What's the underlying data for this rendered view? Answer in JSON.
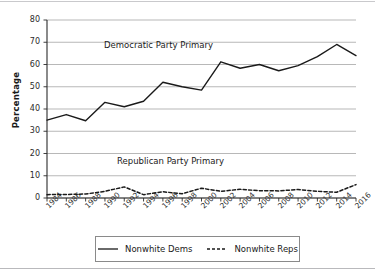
{
  "chart_data": {
    "type": "line",
    "title": "",
    "xlabel": "",
    "ylabel": "Percentage",
    "xlim": [
      1984,
      2016
    ],
    "ylim": [
      0,
      80
    ],
    "ytick_step": 10,
    "grid": true,
    "grid_axis": "y",
    "legend_position": "below-center",
    "x": [
      1984,
      1986,
      1988,
      1990,
      1992,
      1994,
      1996,
      1998,
      2000,
      2002,
      2004,
      2006,
      2008,
      2010,
      2012,
      2014,
      2016
    ],
    "xtick_labels": [
      "1984",
      "1986",
      "1988",
      "1990",
      "1992",
      "1994",
      "1996",
      "1998",
      "2000",
      "2002",
      "2004",
      "2006",
      "2008",
      "2010",
      "2012",
      "2014",
      "2016"
    ],
    "ytick_labels": [
      "0",
      "10",
      "20",
      "30",
      "40",
      "50",
      "60",
      "70",
      "80"
    ],
    "ytick_values": [
      0,
      10,
      20,
      30,
      40,
      50,
      60,
      70,
      80
    ],
    "series": [
      {
        "name": "Nonwhite Dems",
        "style": "solid",
        "color": "#1a1a1a",
        "values": [
          35.0,
          37.5,
          34.7,
          43.0,
          41.0,
          43.5,
          52.0,
          50.0,
          48.5,
          61.2,
          58.3,
          60.0,
          57.2,
          59.5,
          63.5,
          69.0,
          64.0
        ]
      },
      {
        "name": "Nonwhite Reps",
        "style": "dashed",
        "color": "#1a1a1a",
        "values": [
          1.5,
          1.6,
          1.8,
          3.0,
          5.0,
          1.5,
          2.8,
          1.9,
          4.4,
          3.0,
          3.9,
          3.3,
          3.2,
          3.8,
          3.0,
          2.6,
          6.0
        ]
      }
    ],
    "annotations": [
      {
        "text": "Democratic Party Primary",
        "x": 1993.5,
        "y": 66
      },
      {
        "text": "Republican Party Primary",
        "x": 1994.5,
        "y": 13.5
      }
    ],
    "colors": {
      "axis": "#2b2b2b",
      "grid": "#9a9a9a",
      "line": "#1a1a1a",
      "background": "#ffffff",
      "legend_border": "#8a8a8a",
      "rule": "#c9c9cc"
    }
  },
  "legend": {
    "entries": [
      {
        "label": "Nonwhite Dems",
        "style": "solid"
      },
      {
        "label": "Nonwhite Reps",
        "style": "dashed"
      }
    ]
  }
}
